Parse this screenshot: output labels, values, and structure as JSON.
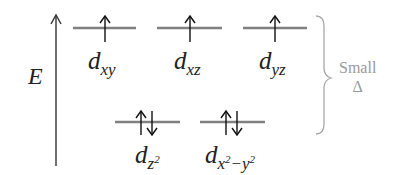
{
  "axis": {
    "label": "E"
  },
  "orbitals": [
    {
      "id": "dxy",
      "base": "d",
      "sub": "xy",
      "electrons": "up",
      "level": "upper"
    },
    {
      "id": "dxz",
      "base": "d",
      "sub": "xz",
      "electrons": "up",
      "level": "upper"
    },
    {
      "id": "dyz",
      "base": "d",
      "sub": "yz",
      "electrons": "up",
      "level": "upper"
    },
    {
      "id": "dz2",
      "base": "d",
      "sub": "z",
      "sup": "2",
      "electrons": "up-down",
      "level": "lower"
    },
    {
      "id": "dx2-y2",
      "base": "d",
      "sub_parts": [
        "x",
        "2",
        "−y",
        "2"
      ],
      "electrons": "up-down",
      "level": "lower"
    }
  ],
  "annotation": {
    "line1": "Small",
    "line2": "Δ"
  },
  "colors": {
    "line": "#808080",
    "arrow": "#111111",
    "brace": "#a8a8a8",
    "note": "#9a9a9a"
  }
}
